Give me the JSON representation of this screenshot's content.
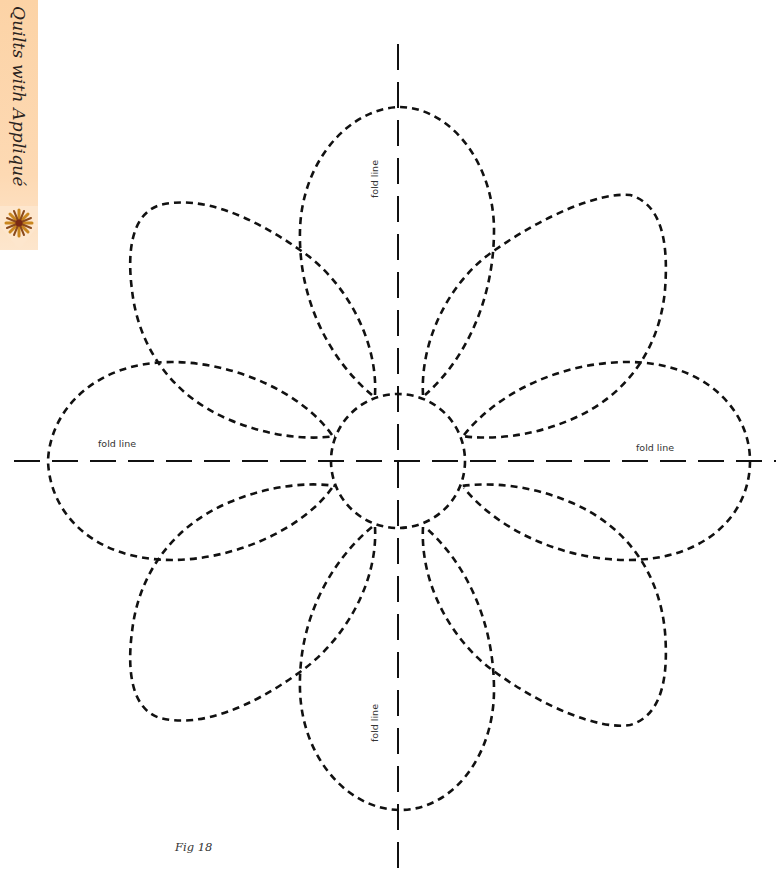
{
  "page": {
    "section_tab": {
      "title": "Quilts with Appliqué",
      "icon": "flower-icon",
      "color": "#fcd3a6"
    },
    "figure": {
      "caption": "Fig 18",
      "description": "Eight-petal flower appliqué template with central circle and fold lines",
      "stroke_color": "#111111",
      "labels": {
        "top": "fold line",
        "bottom": "fold line",
        "left": "fold line",
        "right": "fold line"
      },
      "center": {
        "x": 398,
        "y": 461,
        "radius": 67
      },
      "petal_count": 8
    }
  }
}
